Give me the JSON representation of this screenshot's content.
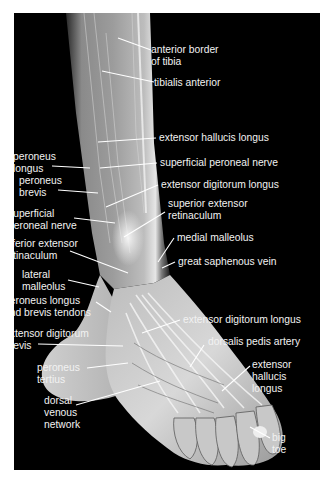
{
  "figure": {
    "background": "#000000",
    "page_background": "#ffffff",
    "text_color": "#f2f2f2",
    "leader_color": "#ffffff"
  },
  "labels": [
    {
      "id": "anterior-border-of-tibia",
      "text": "anterior border\nof tibia",
      "x": 151,
      "y": 44,
      "leader": [
        [
          151,
          50
        ],
        [
          118,
          38
        ]
      ]
    },
    {
      "id": "tibialis-anterior",
      "text": "tibialis anterior",
      "x": 154,
      "y": 77,
      "leader": [
        [
          154,
          82
        ],
        [
          102,
          71
        ]
      ]
    },
    {
      "id": "extensor-hallucis-longus-leg",
      "text": "extensor hallucis longus",
      "x": 159,
      "y": 132,
      "leader": [
        [
          156,
          138
        ],
        [
          98,
          142
        ]
      ]
    },
    {
      "id": "peroneus-longus",
      "text": "peroneus\nlongus",
      "x": 13,
      "y": 151,
      "leader": [
        [
          52,
          166
        ],
        [
          90,
          168
        ]
      ]
    },
    {
      "id": "superficial-peroneal-nerve-upper",
      "text": "superficial peroneal nerve",
      "x": 160,
      "y": 157,
      "leader": [
        [
          157,
          163
        ],
        [
          100,
          168
        ]
      ]
    },
    {
      "id": "peroneus-brevis",
      "text": "peroneus\nbrevis",
      "x": 19,
      "y": 175,
      "leader": [
        [
          58,
          190
        ],
        [
          98,
          193
        ]
      ]
    },
    {
      "id": "extensor-digitorum-longus-leg",
      "text": "extensor digitorum longus",
      "x": 161,
      "y": 179,
      "leader": [
        [
          158,
          185
        ],
        [
          106,
          207
        ]
      ]
    },
    {
      "id": "superior-extensor-retinaculum",
      "text": "superior extensor\nretinaculum",
      "x": 168,
      "y": 198,
      "leader": [
        [
          165,
          212
        ],
        [
          124,
          237
        ]
      ]
    },
    {
      "id": "superficial-peroneal-nerve-lower",
      "text": "superficial\nperoneal nerve",
      "x": 8,
      "y": 208,
      "leader": [
        [
          74,
          218
        ],
        [
          115,
          223
        ]
      ]
    },
    {
      "id": "medial-malleolus",
      "text": "medial malleolus",
      "x": 177,
      "y": 232,
      "leader": [
        [
          174,
          238
        ],
        [
          158,
          262
        ]
      ]
    },
    {
      "id": "inferior-extensor-retinaculum",
      "text": "inferior extensor\nretinaculum",
      "x": 4,
      "y": 238,
      "leader": [
        [
          70,
          251
        ],
        [
          128,
          273
        ]
      ]
    },
    {
      "id": "great-saphenous-vein",
      "text": "great saphenous vein",
      "x": 178,
      "y": 256,
      "leader": [
        [
          175,
          262
        ],
        [
          162,
          268
        ]
      ]
    },
    {
      "id": "lateral-malleolus",
      "text": "lateral\nmalleolus",
      "x": 22,
      "y": 269,
      "leader": [
        [
          68,
          280
        ],
        [
          99,
          287
        ]
      ]
    },
    {
      "id": "peroneus-longus-and-brevis-tendons",
      "text": "peroneus longus\nand brevis tendons",
      "x": 4,
      "y": 295,
      "leader": [
        [
          96,
          302
        ],
        [
          111,
          312
        ]
      ]
    },
    {
      "id": "extensor-digitorum-longus-foot",
      "text": "extensor digitorum longus",
      "x": 183,
      "y": 314,
      "leader": [
        [
          180,
          320
        ],
        [
          142,
          333
        ]
      ]
    },
    {
      "id": "extensor-digitorum-brevis",
      "text": "extensor digitorum\nbrevis",
      "x": 4,
      "y": 328,
      "leader": [
        [
          38,
          344
        ],
        [
          123,
          346
        ]
      ]
    },
    {
      "id": "dorsalis-pedis-artery",
      "text": "dorsalis pedis artery",
      "x": 208,
      "y": 336,
      "leader": [
        [
          204,
          345
        ],
        [
          190,
          367
        ]
      ]
    },
    {
      "id": "extensor-hallucis-longus-foot",
      "text": "extensor\nhallucis\nlongus",
      "x": 252,
      "y": 359,
      "leader": [
        [
          250,
          366
        ],
        [
          222,
          391
        ]
      ]
    },
    {
      "id": "peroneus-tertius",
      "text": "peroneus\ntertius",
      "x": 37,
      "y": 362,
      "leader": [
        [
          87,
          368
        ],
        [
          128,
          363
        ]
      ]
    },
    {
      "id": "dorsal-venous-network",
      "text": "dorsal\nvenous\nnetwork",
      "x": 44,
      "y": 395,
      "leader": [
        [
          76,
          405
        ],
        [
          160,
          381
        ]
      ]
    },
    {
      "id": "big-toe",
      "text": "big\ntoe",
      "x": 272,
      "y": 432,
      "leader": [
        [
          270,
          438
        ],
        [
          250,
          427
        ]
      ]
    }
  ]
}
